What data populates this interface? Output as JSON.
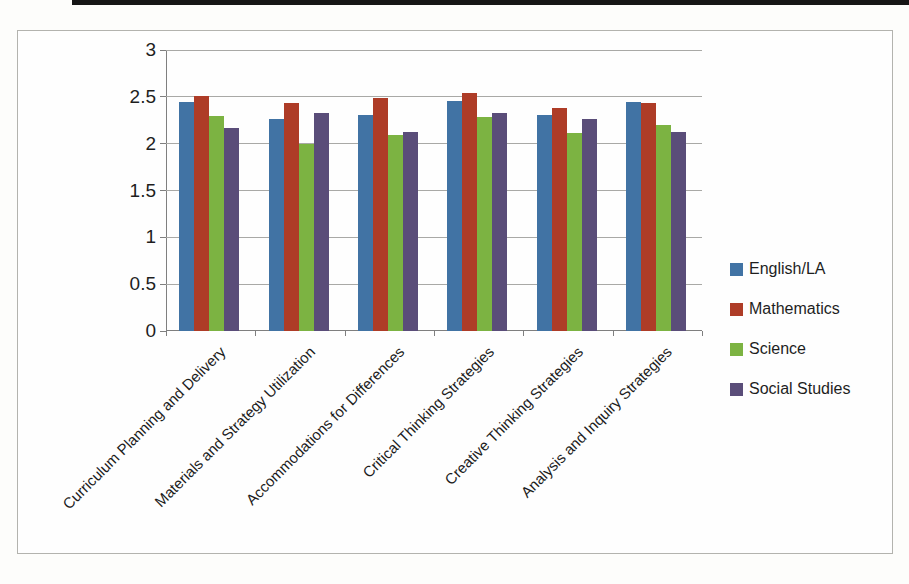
{
  "chart_data": {
    "type": "bar",
    "title": "",
    "xlabel": "",
    "ylabel": "",
    "categories": [
      "Curriculum Planning and Delivery",
      "Materials and Strategy Utilization",
      "Accommodations for Differences",
      "Critical Thinking Strategies",
      "Creative Thinking Strategies",
      "Analysis and Inquiry Strategies"
    ],
    "series": [
      {
        "name": "English/LA",
        "color": "#4173a4",
        "values": [
          2.45,
          2.26,
          2.31,
          2.46,
          2.31,
          2.45
        ]
      },
      {
        "name": "Mathematics",
        "color": "#ae3c27",
        "values": [
          2.51,
          2.43,
          2.49,
          2.54,
          2.38,
          2.43
        ]
      },
      {
        "name": "Science",
        "color": "#7cb342",
        "values": [
          2.3,
          2.0,
          2.09,
          2.28,
          2.11,
          2.2
        ]
      },
      {
        "name": "Social Studies",
        "color": "#5a4d79",
        "values": [
          2.17,
          2.33,
          2.12,
          2.33,
          2.26,
          2.13
        ]
      }
    ],
    "ylim": [
      0,
      3
    ],
    "ytick_step": 0.5,
    "yticks": [
      "0",
      "0.5",
      "1",
      "1.5",
      "2",
      "2.5",
      "3"
    ],
    "grid": true,
    "legend_position": "right",
    "colors": {
      "gridline": "#a9a9a6",
      "axis": "#7f7f7f",
      "text": "#1e1e1e",
      "frame_border": "#b3b3ae",
      "top_rule": "#161616"
    }
  }
}
